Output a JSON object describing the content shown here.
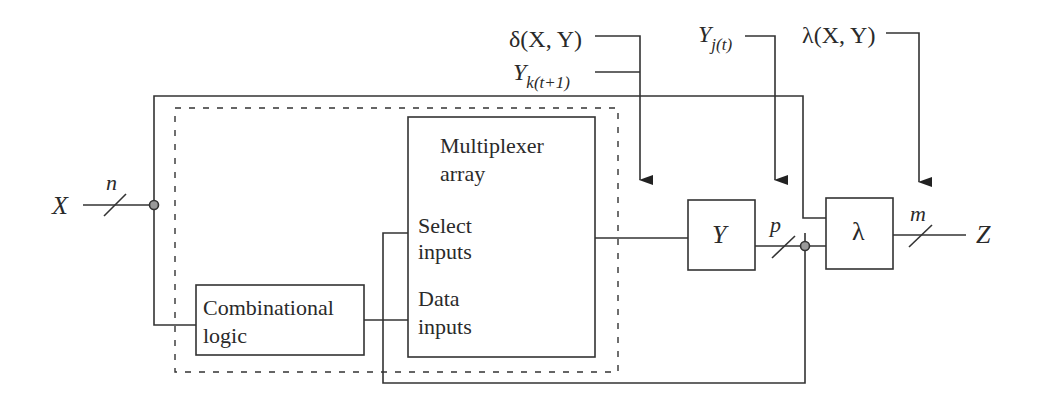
{
  "diagram": {
    "inputs": {
      "x_label": "X",
      "x_width": "n"
    },
    "outputs": {
      "z_label": "Z",
      "z_width": "m"
    },
    "blocks": {
      "combinational_logic": [
        "Combinational",
        "logic"
      ],
      "multiplexer": {
        "title": [
          "Multiplexer",
          "array"
        ],
        "select": [
          "Select",
          "inputs"
        ],
        "data": [
          "Data",
          "inputs"
        ]
      },
      "state_register": "Y",
      "output_logic": "λ"
    },
    "state_bus_width": "p",
    "annotations": {
      "delta": "δ(X, Y)",
      "y_next_base": "Y",
      "y_next_sub": "k(t+1)",
      "y_current_base": "Y",
      "y_current_sub": "j(t)",
      "lambda": "λ(X, Y)"
    }
  }
}
